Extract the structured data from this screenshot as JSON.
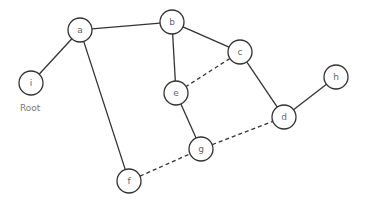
{
  "graph": {
    "nodes": [
      {
        "id": "a",
        "label": "a",
        "x": 80,
        "y": 30
      },
      {
        "id": "b",
        "label": "b",
        "x": 172,
        "y": 22
      },
      {
        "id": "c",
        "label": "c",
        "x": 240,
        "y": 52
      },
      {
        "id": "e",
        "label": "e",
        "x": 176,
        "y": 93
      },
      {
        "id": "h",
        "label": "h",
        "x": 336,
        "y": 77
      },
      {
        "id": "d",
        "label": "d",
        "x": 284,
        "y": 117
      },
      {
        "id": "g",
        "label": "g",
        "x": 201,
        "y": 149
      },
      {
        "id": "f",
        "label": "f",
        "x": 129,
        "y": 181
      },
      {
        "id": "i",
        "label": "i",
        "x": 31,
        "y": 83
      }
    ],
    "edges": [
      {
        "from": "a",
        "to": "i",
        "style": "solid"
      },
      {
        "from": "a",
        "to": "b",
        "style": "solid"
      },
      {
        "from": "a",
        "to": "f",
        "style": "solid"
      },
      {
        "from": "b",
        "to": "c",
        "style": "solid"
      },
      {
        "from": "b",
        "to": "e",
        "style": "solid"
      },
      {
        "from": "c",
        "to": "e",
        "style": "dashed"
      },
      {
        "from": "c",
        "to": "d",
        "style": "solid"
      },
      {
        "from": "d",
        "to": "h",
        "style": "solid"
      },
      {
        "from": "e",
        "to": "g",
        "style": "solid"
      },
      {
        "from": "g",
        "to": "d",
        "style": "dashed"
      },
      {
        "from": "f",
        "to": "g",
        "style": "dashed"
      }
    ],
    "node_radius": 12,
    "root_label": "Root"
  }
}
